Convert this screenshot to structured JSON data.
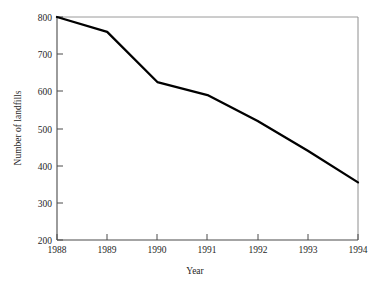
{
  "chart_data": {
    "type": "line",
    "title": "",
    "xlabel": "Year",
    "ylabel": "Number of landfills",
    "x": [
      1988,
      1989,
      1990,
      1991,
      1992,
      1993,
      1994
    ],
    "categories": [
      "1988",
      "1989",
      "1990",
      "1991",
      "1992",
      "1993",
      "1994"
    ],
    "values": [
      800,
      760,
      625,
      590,
      520,
      440,
      355
    ],
    "series": [
      {
        "name": "Number of landfills",
        "values": [
          800,
          760,
          625,
          590,
          520,
          440,
          355
        ]
      }
    ],
    "xlim": [
      1988,
      1994
    ],
    "ylim": [
      200,
      800
    ],
    "xticks": [
      "1988",
      "1989",
      "1990",
      "1991",
      "1992",
      "1993",
      "1994"
    ],
    "yticks": [
      "200",
      "300",
      "400",
      "500",
      "600",
      "700",
      "800"
    ],
    "grid": false,
    "legend": false,
    "legend_position": "none",
    "line_color": "#000000",
    "axis_color": "#555555",
    "background_color": "#ffffff"
  },
  "axes": {
    "y_label": "Number of landfills",
    "x_label": "Year",
    "y_ticks": [
      {
        "label": "800",
        "value": 800
      },
      {
        "label": "700",
        "value": 700
      },
      {
        "label": "600",
        "value": 600
      },
      {
        "label": "500",
        "value": 500
      },
      {
        "label": "400",
        "value": 400
      },
      {
        "label": "300",
        "value": 300
      },
      {
        "label": "200",
        "value": 200
      }
    ],
    "x_ticks": [
      {
        "label": "1988",
        "value": 1988
      },
      {
        "label": "1989",
        "value": 1989
      },
      {
        "label": "1990",
        "value": 1990
      },
      {
        "label": "1991",
        "value": 1991
      },
      {
        "label": "1992",
        "value": 1992
      },
      {
        "label": "1993",
        "value": 1993
      },
      {
        "label": "1994",
        "value": 1994
      }
    ]
  }
}
